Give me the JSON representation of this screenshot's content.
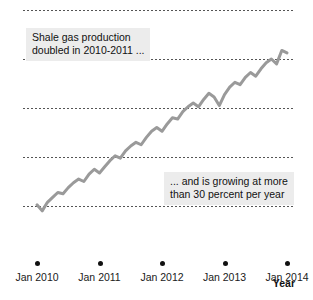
{
  "chart_data": {
    "type": "line",
    "title": "",
    "xlabel": "Year",
    "ylabel": "",
    "ylim": [
      2,
      12
    ],
    "yticks": [
      2,
      4,
      6,
      8,
      10,
      12
    ],
    "ytick_labels": [
      "2",
      "4",
      "6",
      "8",
      "10",
      "12"
    ],
    "xticks": [
      "Jan 2010",
      "Jan 2011",
      "Jan 2012",
      "Jan 2013",
      "Jan 2014"
    ],
    "grid": "horizontal dotted gridlines at 4, 6, 8, 10, 12",
    "legend": "none",
    "series": [
      {
        "name": "Shale gas production",
        "color": "#9a9a9a",
        "x": [
          "Jan 2010",
          "Feb 2010",
          "Mar 2010",
          "Apr 2010",
          "May 2010",
          "Jun 2010",
          "Jul 2010",
          "Aug 2010",
          "Sep 2010",
          "Oct 2010",
          "Nov 2010",
          "Dec 2010",
          "Jan 2011",
          "Feb 2011",
          "Mar 2011",
          "Apr 2011",
          "May 2011",
          "Jun 2011",
          "Jul 2011",
          "Aug 2011",
          "Sep 2011",
          "Oct 2011",
          "Nov 2011",
          "Dec 2011",
          "Jan 2012",
          "Feb 2012",
          "Mar 2012",
          "Apr 2012",
          "May 2012",
          "Jun 2012",
          "Jul 2012",
          "Aug 2012",
          "Sep 2012",
          "Oct 2012",
          "Nov 2012",
          "Dec 2012",
          "Jan 2013",
          "Feb 2013",
          "Mar 2013",
          "Apr 2013",
          "May 2013",
          "Jun 2013",
          "Jul 2013",
          "Aug 2013",
          "Sep 2013",
          "Oct 2013",
          "Nov 2013",
          "Dec 2013",
          "Jan 2014"
        ],
        "values": [
          4.05,
          3.8,
          4.15,
          4.35,
          4.55,
          4.5,
          4.75,
          4.95,
          5.1,
          5.0,
          5.3,
          5.5,
          5.35,
          5.6,
          5.85,
          6.05,
          5.95,
          6.25,
          6.45,
          6.6,
          6.5,
          6.8,
          7.05,
          7.2,
          7.05,
          7.35,
          7.6,
          7.55,
          7.85,
          8.05,
          8.2,
          8.05,
          8.35,
          8.6,
          8.45,
          8.1,
          8.55,
          8.85,
          9.05,
          8.95,
          9.25,
          9.45,
          9.3,
          9.6,
          9.85,
          10.0,
          9.8,
          10.35,
          10.25
        ]
      }
    ],
    "annotations": [
      {
        "id": "callout-1",
        "text": "Shale gas production\ndoubled in 2010-2011 ..."
      },
      {
        "id": "callout-2",
        "text": "... and is growing at more\nthan 30 percent per year"
      }
    ]
  },
  "axes": {
    "x_title": "Year"
  },
  "top_sliver": {
    "text": "······································"
  }
}
